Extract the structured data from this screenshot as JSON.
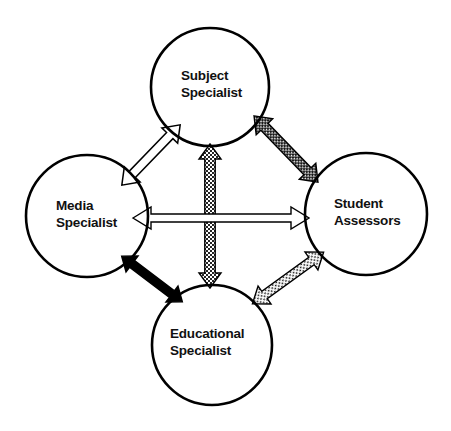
{
  "diagram": {
    "background_color": "#ffffff",
    "outline_color": "#000000",
    "text_color": "#111111",
    "nodes": [
      {
        "id": "subject-specialist",
        "label_line1": "Subject",
        "label_line2": "Specialist",
        "cx": 210,
        "cy": 87,
        "r": 59,
        "position": "top"
      },
      {
        "id": "media-specialist",
        "label_line1": "Media",
        "label_line2": "Specialist",
        "cx": 87,
        "cy": 216,
        "r": 61,
        "position": "left"
      },
      {
        "id": "student-assessors",
        "label_line1": "Student",
        "label_line2": "Assessors",
        "cx": 366,
        "cy": 214,
        "r": 61,
        "position": "right"
      },
      {
        "id": "educational-specialist",
        "label_line1": "Educational",
        "label_line2": "Specialist",
        "cx": 212,
        "cy": 345,
        "r": 60,
        "position": "bottom"
      }
    ],
    "connectors": [
      {
        "id": "media-to-subject",
        "from": "media-specialist",
        "to": "subject-specialist",
        "style": "outline-white",
        "fill_color": "#ffffff",
        "stroke_color": "#000000",
        "double_headed": true
      },
      {
        "id": "subject-to-student",
        "from": "subject-specialist",
        "to": "student-assessors",
        "style": "dark-crosshatch",
        "fill_color": "#2b2b2b",
        "stroke_color": "#000000",
        "double_headed": true
      },
      {
        "id": "media-to-student",
        "from": "media-specialist",
        "to": "student-assessors",
        "style": "outline-white-thin",
        "fill_color": "#ffffff",
        "stroke_color": "#000000",
        "double_headed": true
      },
      {
        "id": "subject-to-educational",
        "from": "subject-specialist",
        "to": "educational-specialist",
        "style": "checkerboard",
        "fill_color": "#555555",
        "stroke_color": "#000000",
        "double_headed": true
      },
      {
        "id": "student-to-educational",
        "from": "student-assessors",
        "to": "educational-specialist",
        "style": "light-stipple",
        "fill_color": "#f2f2f2",
        "stroke_color": "#000000",
        "double_headed": true
      },
      {
        "id": "media-to-educational",
        "from": "media-specialist",
        "to": "educational-specialist",
        "style": "solid-black",
        "fill_color": "#000000",
        "stroke_color": "#000000",
        "double_headed": true
      }
    ]
  }
}
